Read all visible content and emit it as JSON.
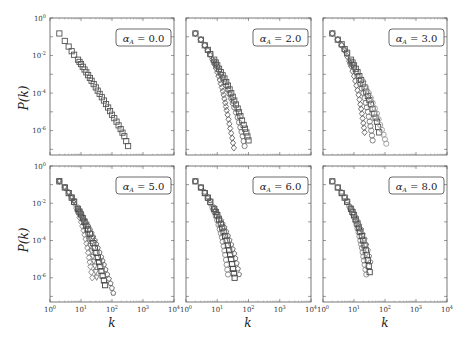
{
  "figure": {
    "ylabel": "P(k)",
    "xlabel": "k",
    "caption_fragment": ""
  },
  "chart_data": {
    "type": "scatter",
    "scale": {
      "x": "log",
      "y": "log"
    },
    "xlim": [
      1,
      10000
    ],
    "ylim": [
      5e-08,
      1
    ],
    "x_tick_labels": [
      "10^0",
      "10^1",
      "10^2",
      "10^3",
      "10^4"
    ],
    "y_tick_labels": [
      "10^0",
      "10^-2",
      "10^-4",
      "10^-6"
    ],
    "xlabel": "k",
    "ylabel": "P(k)",
    "grid": false,
    "legend": "none (panel label box upper right)",
    "markers": [
      "square",
      "diamond",
      "circle",
      "triangle-down",
      "pentagon"
    ],
    "panels": [
      {
        "label": "α_A = 0.0",
        "alpha_A": "0.0",
        "series": [
          {
            "name": "s1",
            "marker": "square",
            "color": "#555555",
            "x": [
              2,
              3,
              4,
              5,
              6,
              8,
              10,
              13,
              17,
              22,
              30,
              40,
              55,
              75,
              100,
              140,
              190,
              250,
              330
            ],
            "y": [
              0.15,
              0.06,
              0.03,
              0.017,
              0.011,
              0.006,
              0.0035,
              0.0018,
              0.0009,
              0.00045,
              0.0002,
              9e-05,
              4e-05,
              1.7e-05,
              7e-06,
              3e-06,
              1.2e-06,
              5e-07,
              1.5e-07
            ]
          }
        ]
      },
      {
        "label": "α_A = 2.0",
        "alpha_A": "2.0",
        "series": [
          {
            "name": "steep",
            "marker": "diamond",
            "color": "#666666",
            "x": [
              2,
              3,
              4,
              5,
              6,
              7,
              8,
              10,
              12,
              14,
              16,
              18,
              20,
              23,
              26,
              30,
              34
            ],
            "y": [
              0.15,
              0.07,
              0.035,
              0.018,
              0.01,
              0.006,
              0.0035,
              0.0013,
              0.0005,
              0.0002,
              8e-05,
              3e-05,
              1.2e-05,
              4e-06,
              1.3e-06,
              4e-07,
              1.2e-07
            ]
          },
          {
            "name": "mid",
            "marker": "circle",
            "color": "#777777",
            "x": [
              2,
              3,
              4,
              5,
              6,
              8,
              10,
              13,
              17,
              22,
              28,
              35,
              45,
              55,
              65,
              75
            ],
            "y": [
              0.15,
              0.07,
              0.035,
              0.02,
              0.012,
              0.005,
              0.0025,
              0.001,
              0.0004,
              0.00015,
              5e-05,
              1.7e-05,
              5e-06,
              1.5e-06,
              5e-07,
              1.5e-07
            ]
          },
          {
            "name": "shallow",
            "marker": "square",
            "color": "#555555",
            "x": [
              2,
              3,
              4,
              5,
              6,
              8,
              10,
              13,
              17,
              22,
              28,
              35,
              45,
              55,
              70,
              85,
              100
            ],
            "y": [
              0.15,
              0.07,
              0.035,
              0.02,
              0.012,
              0.006,
              0.003,
              0.0013,
              0.0006,
              0.00025,
              0.0001,
              4e-05,
              1.5e-05,
              6e-06,
              2e-06,
              8e-07,
              3e-07
            ]
          }
        ]
      },
      {
        "label": "α_A = 3.0",
        "alpha_A": "3.0",
        "series": [
          {
            "name": "steep",
            "marker": "diamond",
            "color": "#666666",
            "x": [
              2,
              3,
              4,
              5,
              6,
              7,
              8,
              10,
              12,
              14,
              16,
              18,
              20,
              22
            ],
            "y": [
              0.15,
              0.07,
              0.035,
              0.018,
              0.009,
              0.005,
              0.0027,
              0.0008,
              0.00025,
              8e-05,
              2.5e-05,
              8e-06,
              2.5e-06,
              8e-07
            ]
          },
          {
            "name": "mid",
            "marker": "circle",
            "color": "#777777",
            "x": [
              2,
              3,
              4,
              5,
              6,
              8,
              10,
              13,
              16,
              20,
              24,
              28,
              32,
              36,
              40
            ],
            "y": [
              0.15,
              0.07,
              0.035,
              0.02,
              0.012,
              0.005,
              0.0023,
              0.0008,
              0.0003,
              0.0001,
              3e-05,
              1e-05,
              3e-06,
              1e-06,
              3e-07
            ]
          },
          {
            "name": "shallow",
            "marker": "square",
            "color": "#555555",
            "x": [
              2,
              3,
              4,
              5,
              6,
              8,
              10,
              13,
              17,
              22,
              28,
              35,
              45,
              55,
              65
            ],
            "y": [
              0.15,
              0.07,
              0.04,
              0.022,
              0.014,
              0.006,
              0.003,
              0.0013,
              0.0005,
              0.0002,
              7e-05,
              2.5e-05,
              8e-06,
              3e-06,
              8e-07
            ]
          },
          {
            "name": "widest",
            "marker": "circle-open",
            "color": "#999999",
            "x": [
              20,
              30,
              40,
              55,
              70,
              90,
              110
            ],
            "y": [
              0.0004,
              0.0001,
              3e-05,
              8e-06,
              2e-06,
              6e-07,
              2e-07
            ]
          }
        ]
      },
      {
        "label": "α_A = 5.0",
        "alpha_A": "5.0",
        "series": [
          {
            "name": "s-diamond",
            "marker": "diamond",
            "color": "#888888",
            "x": [
              2,
              3,
              4,
              5,
              6,
              7,
              8,
              10,
              12,
              14,
              16,
              18,
              20,
              23
            ],
            "y": [
              0.15,
              0.07,
              0.035,
              0.018,
              0.01,
              0.0055,
              0.003,
              0.001,
              0.00035,
              0.00012,
              4e-05,
              1.2e-05,
              4e-06,
              1e-06
            ]
          },
          {
            "name": "s-triangle",
            "marker": "triangle-down",
            "color": "#777777",
            "x": [
              2,
              3,
              4,
              5,
              6,
              8,
              10,
              13,
              16,
              20,
              24,
              28,
              32
            ],
            "y": [
              0.15,
              0.07,
              0.035,
              0.02,
              0.012,
              0.0045,
              0.002,
              0.0006,
              0.0002,
              5e-05,
              1.3e-05,
              4e-06,
              1e-06
            ]
          },
          {
            "name": "s-square",
            "marker": "square",
            "color": "#444444",
            "x": [
              2,
              3,
              4,
              5,
              6,
              8,
              10,
              13,
              17,
              22,
              28,
              35,
              42,
              50,
              60
            ],
            "y": [
              0.15,
              0.07,
              0.035,
              0.02,
              0.012,
              0.005,
              0.0025,
              0.001,
              0.0004,
              0.00013,
              4e-05,
              1.2e-05,
              4e-06,
              1.3e-06,
              4e-07
            ]
          },
          {
            "name": "s-pentagon",
            "marker": "pentagon",
            "color": "#666666",
            "x": [
              2,
              3,
              4,
              5,
              6,
              8,
              10,
              13,
              17,
              22,
              28,
              35,
              45,
              55,
              70,
              90,
              110
            ],
            "y": [
              0.15,
              0.07,
              0.04,
              0.022,
              0.014,
              0.006,
              0.003,
              0.0013,
              0.0006,
              0.00025,
              0.0001,
              4e-05,
              1.3e-05,
              5e-06,
              1.5e-06,
              5e-07,
              1.5e-07
            ]
          }
        ]
      },
      {
        "label": "α_A = 6.0",
        "alpha_A": "6.0",
        "series": [
          {
            "name": "s-circle",
            "marker": "circle",
            "color": "#888888",
            "x": [
              2,
              3,
              4,
              5,
              6,
              7,
              8,
              10,
              12,
              14,
              16,
              18,
              20,
              22
            ],
            "y": [
              0.15,
              0.07,
              0.035,
              0.018,
              0.01,
              0.006,
              0.0035,
              0.0012,
              0.0004,
              0.00015,
              5e-05,
              1.7e-05,
              5e-06,
              1.5e-06
            ]
          },
          {
            "name": "s-square",
            "marker": "square",
            "color": "#444444",
            "x": [
              2,
              3,
              4,
              5,
              6,
              8,
              10,
              13,
              16,
              20,
              24,
              28,
              32,
              36
            ],
            "y": [
              0.15,
              0.07,
              0.035,
              0.02,
              0.012,
              0.005,
              0.0023,
              0.0008,
              0.0003,
              0.0001,
              3e-05,
              1e-05,
              3e-06,
              1e-06
            ]
          },
          {
            "name": "s-pentagon",
            "marker": "pentagon",
            "color": "#666666",
            "x": [
              2,
              3,
              4,
              5,
              6,
              8,
              10,
              13,
              17,
              22,
              28,
              35,
              42,
              50
            ],
            "y": [
              0.15,
              0.07,
              0.04,
              0.022,
              0.014,
              0.006,
              0.003,
              0.0012,
              0.0005,
              0.00018,
              6e-05,
              2e-05,
              6e-06,
              1.5e-06
            ]
          }
        ]
      },
      {
        "label": "α_A = 8.0",
        "alpha_A": "8.0",
        "series": [
          {
            "name": "s-circle",
            "marker": "circle",
            "color": "#888888",
            "x": [
              2,
              3,
              4,
              5,
              6,
              7,
              8,
              10,
              12,
              14,
              16,
              18,
              20,
              22,
              25
            ],
            "y": [
              0.15,
              0.07,
              0.035,
              0.02,
              0.012,
              0.007,
              0.0045,
              0.0018,
              0.0007,
              0.00028,
              0.0001,
              4e-05,
              1.4e-05,
              5e-06,
              1.5e-06
            ]
          },
          {
            "name": "s-square",
            "marker": "square",
            "color": "#444444",
            "x": [
              2,
              3,
              4,
              5,
              6,
              8,
              10,
              13,
              16,
              20,
              24,
              28,
              32
            ],
            "y": [
              0.15,
              0.07,
              0.035,
              0.02,
              0.012,
              0.005,
              0.0023,
              0.0008,
              0.0003,
              0.0001,
              3e-05,
              9e-06,
              2e-06
            ]
          },
          {
            "name": "s-pentagon",
            "marker": "pentagon",
            "color": "#777777",
            "x": [
              2,
              3,
              4,
              5,
              6,
              8,
              10,
              13,
              17,
              22,
              28,
              34
            ],
            "y": [
              0.15,
              0.07,
              0.04,
              0.022,
              0.014,
              0.006,
              0.003,
              0.0011,
              0.0004,
              0.00012,
              3e-05,
              7e-06
            ]
          }
        ]
      }
    ]
  }
}
